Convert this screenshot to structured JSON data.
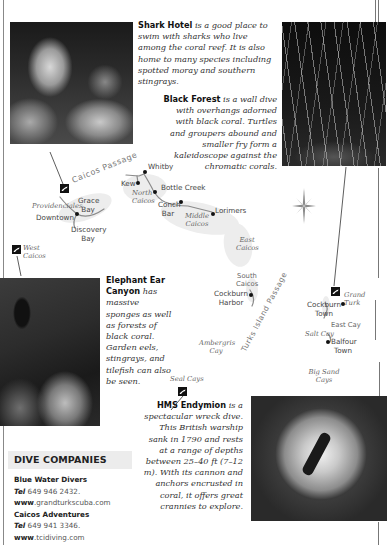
{
  "page": {
    "background": "#ffffff"
  },
  "dive_sites": {
    "shark_hotel": {
      "name": "Shark Hotel",
      "description": " is a good place to swim with sharks who live among the coral reef. It is also home to many species including spotted moray and southern stingrays."
    },
    "black_forest": {
      "name": "Black Forest",
      "description": " is a wall dive with overhangs adorned with black coral. Turtles and groupers abound and smaller fry form a kaleidoscope against the chromatic corals."
    },
    "elephant_ear_canyon": {
      "name": "Elephant Ear Canyon",
      "description": " has massive sponges as well as forests of black coral. Garden eels, stingrays, and tilefish can also be seen."
    },
    "hms_endymion": {
      "name": "HMS Endymion",
      "description": " is a spectacular wreck dive. This British warship sank in 1790 and rests at a range of depths between 25–40 ft (7–12 m). With its cannon and anchors encrusted in coral, it offers great crannies to explore."
    }
  },
  "map": {
    "water_labels": {
      "caicos_passage": "Caicos Passage",
      "turks_island_passage": "Turks Island Passage"
    },
    "island_labels": {
      "providenciales": "Providenciales",
      "north_caicos": "North Caicos",
      "middle_caicos": "Middle Caicos",
      "east_caicos": "East Caicos",
      "south_caicos": "South Caicos",
      "west_caicos": "West Caicos",
      "grand_turk": "Grand Turk",
      "salt_cay": "Salt Cay",
      "east_cay": "East Cay",
      "ambergris_cay": "Ambergris Cay",
      "big_sand_cays": "Big Sand Cays",
      "seal_cays": "Seal Cays"
    },
    "town_labels": {
      "downtown": "Downtown",
      "grace_bay": "Grace Bay",
      "discovery_bay": "Discovery Bay",
      "kew": "Kew",
      "whitby": "Whitby",
      "bottle_creek": "Bottle Creek",
      "conch_bar": "Conch Bar",
      "lorimers": "Lorimers",
      "cockburn_harbor": "Cockburn Harbor",
      "cockburn_town": "Cockburn Town",
      "balfour_town": "Balfour Town"
    },
    "icons": [
      "dive-site-marker",
      "compass-rose-icon",
      "town-dot"
    ]
  },
  "dive_companies": {
    "heading": "DIVE COMPANIES",
    "tel_label": "Tel",
    "www_label": "www",
    "companies": [
      {
        "name": "Blue Water Divers",
        "tel": " 649 946 2432.",
        "web": ".grandturkscuba.com"
      },
      {
        "name": "Caicos Adventures",
        "tel": " 649 941 3346.",
        "web": ".tcidiving.com"
      }
    ]
  }
}
